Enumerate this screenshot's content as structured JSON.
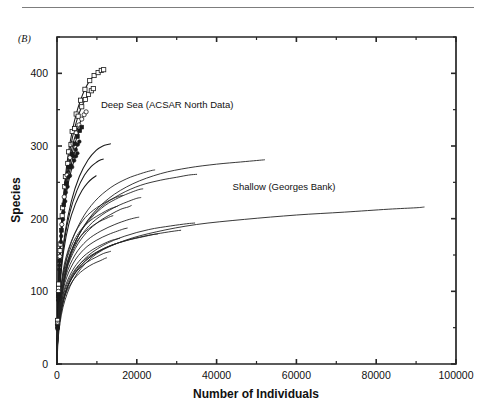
{
  "figure": {
    "panel_label": "(B)",
    "has_top_rule": true
  },
  "chart_data": {
    "type": "line",
    "title": "",
    "subtitle": "",
    "xlabel": "Number of Individuals",
    "ylabel": "Species",
    "xlim": [
      0,
      100000
    ],
    "ylim": [
      0,
      450
    ],
    "grid": false,
    "legend_position": "inline-annotations",
    "x_ticks": [
      0,
      20000,
      40000,
      60000,
      80000,
      100000
    ],
    "x_tick_labels": [
      "0",
      "20000",
      "40000",
      "60000",
      "80000",
      "100000"
    ],
    "x_minor_ticks": [
      10000,
      30000,
      50000,
      70000,
      90000
    ],
    "y_ticks": [
      0,
      100,
      200,
      300,
      400
    ],
    "y_tick_labels": [
      "0",
      "100",
      "200",
      "300",
      "400"
    ],
    "y_minor_ticks": [
      50,
      150,
      250,
      350,
      450
    ],
    "annotations": [
      {
        "text": "Deep Sea (ACSAR North Data)",
        "x": 11000,
        "y": 352
      },
      {
        "text": "Shallow (Georges Bank)",
        "x": 44000,
        "y": 240
      }
    ],
    "series": [
      {
        "name": "deep-sea-1",
        "group": "Deep Sea (ACSAR North Data)",
        "marker": "open-square",
        "x": [
          0,
          150,
          400,
          800,
          1400,
          2100,
          2900,
          3800,
          4800,
          5900,
          7000,
          8200,
          9300,
          10300,
          11100,
          11700
        ],
        "y": [
          0,
          60,
          110,
          165,
          215,
          258,
          292,
          320,
          344,
          363,
          378,
          390,
          397,
          401,
          404,
          405
        ]
      },
      {
        "name": "deep-sea-2",
        "group": "Deep Sea (ACSAR North Data)",
        "marker": "open-square",
        "x": [
          0,
          140,
          380,
          760,
          1300,
          1950,
          2700,
          3500,
          4400,
          5300,
          6200,
          7100,
          7900,
          8600,
          9100
        ],
        "y": [
          0,
          56,
          104,
          156,
          204,
          244,
          276,
          302,
          324,
          341,
          354,
          364,
          371,
          376,
          379
        ]
      },
      {
        "name": "deep-sea-3",
        "group": "Deep Sea (ACSAR North Data)",
        "marker": "open-circle",
        "x": [
          0,
          130,
          350,
          700,
          1200,
          1800,
          2500,
          3250,
          4000,
          4800,
          5500,
          6200,
          6800,
          7300
        ],
        "y": [
          0,
          54,
          100,
          148,
          192,
          230,
          260,
          284,
          303,
          318,
          329,
          337,
          343,
          347
        ]
      },
      {
        "name": "deep-sea-4",
        "group": "Deep Sea (ACSAR North Data)",
        "marker": "filled-square",
        "x": [
          0,
          120,
          330,
          660,
          1120,
          1700,
          2350,
          3050,
          3750,
          4450,
          5100,
          5700,
          6200
        ],
        "y": [
          0,
          52,
          96,
          142,
          184,
          219,
          248,
          271,
          289,
          303,
          313,
          321,
          326
        ]
      },
      {
        "name": "deep-sea-5",
        "group": "Deep Sea (ACSAR North Data)",
        "marker": "filled-circle",
        "x": [
          0,
          115,
          310,
          620,
          1050,
          1600,
          2200,
          2850,
          3500,
          4100,
          4700,
          5200,
          5600
        ],
        "y": [
          0,
          50,
          92,
          136,
          176,
          209,
          236,
          257,
          273,
          286,
          295,
          302,
          306
        ]
      },
      {
        "name": "deep-sea-6",
        "group": "Deep Sea (ACSAR North Data)",
        "marker": "filled-circle",
        "x": [
          0,
          110,
          290,
          580,
          980,
          1500,
          2050,
          2650,
          3250,
          3800,
          4300,
          4750,
          5100
        ],
        "y": [
          0,
          48,
          88,
          130,
          168,
          199,
          224,
          244,
          259,
          271,
          280,
          286,
          290
        ]
      },
      {
        "name": "deep-sea-7",
        "group": "Deep Sea (ACSAR North Data)",
        "marker": "none",
        "x": [
          0,
          250,
          900,
          2000,
          3600,
          5600,
          7800,
          9800,
          11500,
          12700,
          13400
        ],
        "y": [
          0,
          62,
          125,
          180,
          224,
          258,
          281,
          294,
          300,
          302,
          303
        ]
      },
      {
        "name": "deep-sea-8",
        "group": "Deep Sea (ACSAR North Data)",
        "marker": "none",
        "x": [
          0,
          230,
          820,
          1800,
          3200,
          5000,
          6900,
          8600,
          10000,
          11000,
          11600
        ],
        "y": [
          0,
          58,
          117,
          168,
          208,
          239,
          260,
          272,
          278,
          281,
          282
        ]
      },
      {
        "name": "deep-sea-9",
        "group": "Deep Sea (ACSAR North Data)",
        "marker": "none",
        "x": [
          0,
          200,
          750,
          1650,
          2950,
          4600,
          6300,
          7800,
          9000,
          9800
        ],
        "y": [
          0,
          54,
          108,
          155,
          192,
          220,
          239,
          250,
          256,
          259
        ]
      },
      {
        "name": "shallow-1",
        "group": "Shallow (Georges Bank)",
        "marker": "none",
        "x": [
          0,
          400,
          1600,
          4000,
          8000,
          13000,
          19000,
          26000,
          33000,
          40000,
          46000,
          50000,
          52000
        ],
        "y": [
          0,
          58,
          108,
          160,
          200,
          228,
          248,
          262,
          270,
          275,
          278,
          280,
          281
        ]
      },
      {
        "name": "shallow-2",
        "group": "Shallow (Georges Bank)",
        "marker": "none",
        "x": [
          0,
          500,
          2000,
          5000,
          10000,
          17000,
          25000,
          35000,
          47000,
          60000,
          72000,
          83000,
          90000,
          92000
        ],
        "y": [
          0,
          46,
          88,
          124,
          152,
          170,
          182,
          192,
          199,
          205,
          209,
          213,
          215,
          216
        ]
      },
      {
        "name": "shallow-3",
        "group": "Shallow (Georges Bank)",
        "marker": "none",
        "x": [
          0,
          350,
          1400,
          3400,
          6800,
          11000,
          16000,
          21000,
          26000,
          30000,
          33000,
          35000
        ],
        "y": [
          0,
          56,
          104,
          152,
          190,
          216,
          234,
          246,
          253,
          257,
          260,
          261
        ]
      },
      {
        "name": "shallow-4",
        "group": "Shallow (Georges Bank)",
        "marker": "none",
        "x": [
          0,
          300,
          1200,
          3000,
          6000,
          9500,
          13500,
          17500,
          21000,
          23500,
          24500
        ],
        "y": [
          0,
          58,
          110,
          158,
          197,
          224,
          243,
          255,
          262,
          266,
          267
        ]
      },
      {
        "name": "shallow-5",
        "group": "Shallow (Georges Bank)",
        "marker": "none",
        "x": [
          0,
          280,
          1100,
          2700,
          5400,
          8600,
          12000,
          15500,
          18500,
          20500,
          21500
        ],
        "y": [
          0,
          52,
          98,
          142,
          177,
          201,
          218,
          229,
          236,
          240,
          241
        ]
      },
      {
        "name": "shallow-6",
        "group": "Shallow (Georges Bank)",
        "marker": "none",
        "x": [
          0,
          260,
          1000,
          2500,
          5000,
          8000,
          11500,
          15000,
          18000,
          20000,
          21000
        ],
        "y": [
          0,
          48,
          92,
          134,
          167,
          190,
          206,
          217,
          224,
          228,
          229
        ]
      },
      {
        "name": "shallow-7",
        "group": "Shallow (Georges Bank)",
        "marker": "none",
        "x": [
          0,
          240,
          950,
          2300,
          4600,
          7400,
          10500,
          13500,
          16000,
          17800,
          18600
        ],
        "y": [
          0,
          46,
          88,
          128,
          159,
          181,
          196,
          206,
          213,
          216,
          218
        ]
      },
      {
        "name": "shallow-8",
        "group": "Shallow (Georges Bank)",
        "marker": "none",
        "x": [
          0,
          300,
          1300,
          3300,
          6800,
          11500,
          17000,
          23000,
          28500,
          32500,
          34500
        ],
        "y": [
          0,
          42,
          80,
          116,
          144,
          163,
          176,
          185,
          190,
          193,
          194
        ]
      },
      {
        "name": "shallow-9",
        "group": "Shallow (Georges Bank)",
        "marker": "none",
        "x": [
          0,
          280,
          1200,
          3000,
          6200,
          10500,
          15500,
          21000,
          26000,
          29500,
          31000
        ],
        "y": [
          0,
          40,
          76,
          110,
          137,
          155,
          167,
          175,
          180,
          183,
          184
        ]
      },
      {
        "name": "shallow-10",
        "group": "Shallow (Georges Bank)",
        "marker": "none",
        "x": [
          0,
          250,
          1050,
          2600,
          5400,
          9000,
          13000,
          17500,
          21500,
          24000,
          25200
        ],
        "y": [
          0,
          38,
          73,
          106,
          132,
          150,
          162,
          170,
          175,
          178,
          179
        ]
      },
      {
        "name": "shallow-11",
        "group": "Shallow (Georges Bank)",
        "marker": "none",
        "x": [
          0,
          220,
          900,
          2200,
          4500,
          7500,
          11000,
          14500,
          17500,
          19500,
          20500
        ],
        "y": [
          0,
          44,
          84,
          121,
          150,
          170,
          183,
          192,
          198,
          201,
          202
        ]
      },
      {
        "name": "shallow-12",
        "group": "Shallow (Georges Bank)",
        "marker": "none",
        "x": [
          0,
          200,
          820,
          2000,
          4100,
          6800,
          9800,
          12800,
          15200,
          16800,
          17600
        ],
        "y": [
          0,
          40,
          77,
          112,
          139,
          158,
          170,
          178,
          183,
          186,
          187
        ]
      },
      {
        "name": "shallow-13",
        "group": "Shallow (Georges Bank)",
        "marker": "none",
        "x": [
          0,
          180,
          740,
          1800,
          3700,
          6100,
          8800,
          11500,
          13600,
          15000,
          15700
        ],
        "y": [
          0,
          36,
          70,
          102,
          127,
          145,
          157,
          165,
          170,
          172,
          173
        ]
      },
      {
        "name": "shallow-14",
        "group": "Shallow (Georges Bank)",
        "marker": "none",
        "x": [
          0,
          170,
          680,
          1650,
          3400,
          5600,
          8100,
          10600,
          12600,
          13900,
          14500
        ],
        "y": [
          0,
          34,
          66,
          96,
          120,
          137,
          148,
          156,
          161,
          164,
          165
        ]
      },
      {
        "name": "shallow-15",
        "group": "Shallow (Georges Bank)",
        "marker": "none",
        "x": [
          0,
          160,
          640,
          1550,
          3200,
          5200,
          7500,
          9800,
          11600,
          12800,
          13400
        ],
        "y": [
          0,
          32,
          62,
          90,
          113,
          129,
          140,
          147,
          152,
          154,
          155
        ]
      },
      {
        "name": "shallow-16",
        "group": "Shallow (Georges Bank)",
        "marker": "none",
        "x": [
          0,
          150,
          600,
          1450,
          3000,
          4900,
          7000,
          9100,
          10800,
          11900,
          12400
        ],
        "y": [
          0,
          30,
          58,
          85,
          106,
          121,
          131,
          138,
          142,
          145,
          146
        ]
      },
      {
        "name": "mid-1",
        "group": "Shallow (Georges Bank)",
        "marker": "none",
        "x": [
          0,
          190,
          780,
          1900,
          3900,
          6400,
          9200,
          12000,
          14200,
          15700,
          16400
        ],
        "y": [
          0,
          50,
          96,
          139,
          173,
          197,
          212,
          222,
          228,
          231,
          232
        ]
      },
      {
        "name": "mid-2",
        "group": "Shallow (Georges Bank)",
        "marker": "none",
        "x": [
          0,
          175,
          720,
          1750,
          3600,
          5900,
          8500,
          11100,
          13100,
          14500,
          15100
        ],
        "y": [
          0,
          47,
          90,
          130,
          162,
          184,
          198,
          207,
          213,
          216,
          217
        ]
      },
      {
        "name": "mid-3",
        "group": "Shallow (Georges Bank)",
        "marker": "none",
        "x": [
          0,
          165,
          670,
          1630,
          3350,
          5500,
          7900,
          10300,
          12200,
          13400,
          14000
        ],
        "y": [
          0,
          44,
          85,
          122,
          152,
          173,
          186,
          195,
          200,
          203,
          204
        ]
      }
    ]
  }
}
